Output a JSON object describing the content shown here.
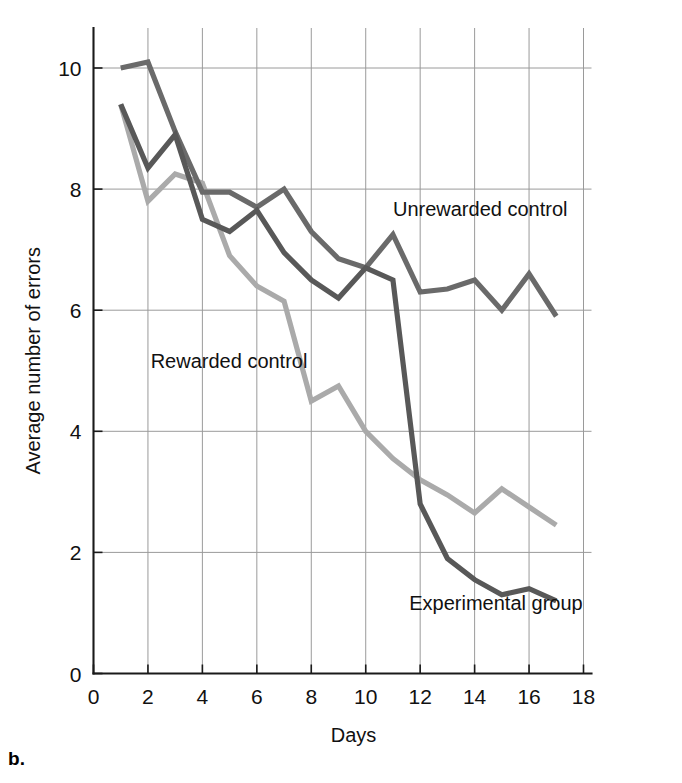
{
  "panel": {
    "letter": "b."
  },
  "chart_data": {
    "type": "line",
    "title": "",
    "xlabel": "Days",
    "ylabel": "Average number of errors",
    "xlim": [
      0,
      18
    ],
    "ylim": [
      0,
      10.6
    ],
    "xticks": [
      0,
      2,
      4,
      6,
      8,
      10,
      12,
      14,
      16,
      18
    ],
    "xtick_labels": [
      "0",
      "2",
      "4",
      "6",
      "8",
      "10",
      "12",
      "14",
      "16",
      "18"
    ],
    "yticks": [
      0,
      2,
      4,
      6,
      8,
      10
    ],
    "ytick_labels": [
      "0",
      "2",
      "4",
      "6",
      "8",
      "10"
    ],
    "grid": true,
    "grid_color": "#9a9a9a",
    "legend_position": "inline-annotations",
    "x": [
      1,
      2,
      3,
      4,
      5,
      6,
      7,
      8,
      9,
      10,
      11,
      12,
      13,
      14,
      15,
      16,
      17
    ],
    "series": [
      {
        "name": "Unrewarded control",
        "color": "#6a6a6a",
        "label": "Unrewarded control",
        "label_x": 11.0,
        "label_y": 7.55,
        "values": [
          10.0,
          10.1,
          8.95,
          7.95,
          7.95,
          7.7,
          8.0,
          7.3,
          6.85,
          6.7,
          7.25,
          6.3,
          6.35,
          6.5,
          6.0,
          6.6,
          5.9
        ]
      },
      {
        "name": "Experimental group",
        "color": "#585858",
        "label": "Experimental group",
        "label_x": 11.6,
        "label_y": 1.05,
        "values": [
          9.4,
          8.35,
          8.9,
          7.5,
          7.3,
          7.65,
          6.95,
          6.5,
          6.2,
          6.7,
          6.5,
          2.8,
          1.9,
          1.55,
          1.3,
          1.4,
          1.2
        ]
      },
      {
        "name": "Rewarded control",
        "color": "#aaaaaa",
        "label": "Rewarded control",
        "label_x": 2.1,
        "label_y": 5.05,
        "values": [
          9.4,
          7.8,
          8.25,
          8.1,
          6.9,
          6.4,
          6.15,
          4.5,
          4.75,
          4.0,
          3.55,
          3.2,
          2.95,
          2.65,
          3.05,
          2.75,
          2.45
        ]
      }
    ]
  }
}
